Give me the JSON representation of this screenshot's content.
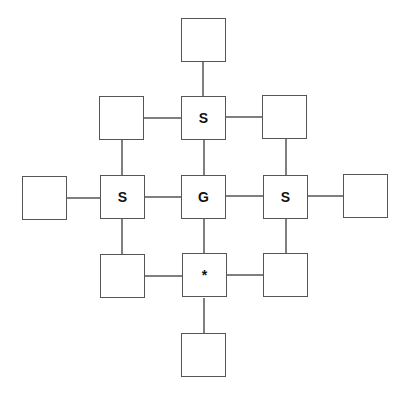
{
  "diagram": {
    "type": "grid-graph",
    "colors": {
      "stroke": "#555555",
      "background": "#ffffff",
      "text": "#111111"
    },
    "nodes": [
      {
        "id": "top",
        "label": "",
        "x": 181,
        "y": 18
      },
      {
        "id": "top-left",
        "label": "",
        "x": 99,
        "y": 96
      },
      {
        "id": "top-mid",
        "label": "S",
        "x": 181,
        "y": 96
      },
      {
        "id": "top-right",
        "label": "",
        "x": 262,
        "y": 95
      },
      {
        "id": "far-left",
        "label": "",
        "x": 22,
        "y": 176
      },
      {
        "id": "mid-left",
        "label": "S",
        "x": 100,
        "y": 175
      },
      {
        "id": "center",
        "label": "G",
        "x": 181,
        "y": 175
      },
      {
        "id": "mid-right",
        "label": "S",
        "x": 263,
        "y": 175
      },
      {
        "id": "far-right",
        "label": "",
        "x": 343,
        "y": 174
      },
      {
        "id": "bot-left",
        "label": "",
        "x": 100,
        "y": 254
      },
      {
        "id": "bot-mid",
        "label": "*",
        "x": 182,
        "y": 253
      },
      {
        "id": "bot-right",
        "label": "",
        "x": 263,
        "y": 253
      },
      {
        "id": "bottom",
        "label": "",
        "x": 181,
        "y": 333
      }
    ],
    "edges": [
      [
        "top",
        "top-mid"
      ],
      [
        "top-left",
        "top-mid"
      ],
      [
        "top-mid",
        "top-right"
      ],
      [
        "top-left",
        "mid-left"
      ],
      [
        "top-mid",
        "center"
      ],
      [
        "top-right",
        "mid-right"
      ],
      [
        "far-left",
        "mid-left"
      ],
      [
        "mid-left",
        "center"
      ],
      [
        "center",
        "mid-right"
      ],
      [
        "mid-right",
        "far-right"
      ],
      [
        "mid-left",
        "bot-left"
      ],
      [
        "center",
        "bot-mid"
      ],
      [
        "mid-right",
        "bot-right"
      ],
      [
        "bot-left",
        "bot-mid"
      ],
      [
        "bot-mid",
        "bot-right"
      ],
      [
        "bot-mid",
        "bottom"
      ]
    ]
  }
}
